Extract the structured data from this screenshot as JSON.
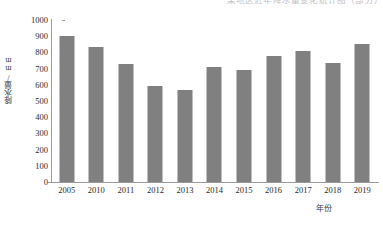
{
  "top_clipped_text": "某地区近年降水量变化统计图（部分）",
  "chart_data": {
    "type": "bar",
    "title": "",
    "subtitle": "",
    "xlabel": "年份",
    "ylabel": "降水量/mm",
    "categories": [
      "2005",
      "2010",
      "2011",
      "2012",
      "2013",
      "2014",
      "2015",
      "2016",
      "2017",
      "2018",
      "2019"
    ],
    "values": [
      900,
      835,
      728,
      595,
      570,
      712,
      692,
      775,
      810,
      737,
      855
    ],
    "ylim": [
      0,
      1000
    ],
    "y_ticks": [
      "1000",
      "900",
      "800",
      "700",
      "600",
      "500",
      "400",
      "300",
      "200",
      "100",
      "0"
    ],
    "y_tick_values": [
      1000,
      900,
      800,
      700,
      600,
      500,
      400,
      300,
      200,
      100,
      0
    ],
    "grid": false,
    "legend": null,
    "legend_position": "none",
    "bar_color": "#808080",
    "axis_color": "#9a9a9a",
    "background_color": "#ffffff",
    "text_color": "#2b2b2b"
  }
}
